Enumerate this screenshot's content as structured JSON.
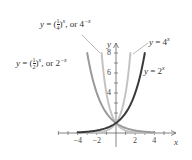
{
  "chart_data": {
    "type": "line",
    "title": "",
    "xlabel": "x",
    "ylabel": "y",
    "xlim": [
      -4.5,
      5
    ],
    "ylim": [
      0,
      8
    ],
    "x_ticks": [
      -4,
      -2,
      2,
      4
    ],
    "x_tick_labels": [
      "−4",
      "−2",
      "2",
      "4"
    ],
    "y_ticks": [
      4,
      6,
      8
    ],
    "y_tick_labels": [
      "4",
      "6",
      "8"
    ],
    "grid": false,
    "series": [
      {
        "name": "y = 2^x",
        "label": "y = 2",
        "exp": "x",
        "color": "#3a3a3a",
        "x": [
          -4,
          -3,
          -2,
          -1,
          0,
          1,
          2,
          3
        ],
        "values": [
          0.0625,
          0.125,
          0.25,
          0.5,
          1,
          2,
          4,
          8
        ]
      },
      {
        "name": "y = 4^x",
        "label": "y = 4",
        "exp": "x",
        "color": "#c4c4c4",
        "x": [
          -4,
          -3,
          -2,
          -1,
          0,
          0.5,
          1,
          1.5
        ],
        "values": [
          0.0039,
          0.0156,
          0.0625,
          0.25,
          1,
          2,
          4,
          8
        ]
      },
      {
        "name": "y = (1/2)^x, or 2^-x",
        "color": "#9a9a9a",
        "x": [
          -3,
          -2,
          -1,
          0,
          1,
          2,
          3,
          4
        ],
        "values": [
          8,
          4,
          2,
          1,
          0.5,
          0.25,
          0.125,
          0.0625
        ]
      },
      {
        "name": "y = (1/4)^x, or 4^-x",
        "color": "#c4c4c4",
        "x": [
          -1.5,
          -1,
          -0.5,
          0,
          1,
          2,
          3,
          4
        ],
        "values": [
          8,
          4,
          2,
          1,
          0.25,
          0.0625,
          0.0156,
          0.0039
        ]
      }
    ],
    "annotations": [
      "y = (1/4)^x, or 4^−x",
      "y = (1/2)^x, or 2^−x",
      "y = 4^x",
      "y = 2^x"
    ]
  },
  "labels": {
    "quarter": {
      "y": "y",
      "eq": " = (",
      "num": "1",
      "den": "4",
      "close": ")",
      "exp": "x",
      "or": ", or 4",
      "or_exp": "−x"
    },
    "half": {
      "y": "y",
      "eq": " = (",
      "num": "1",
      "den": "2",
      "close": ")",
      "exp": "x",
      "or": ", or 2",
      "or_exp": "−x"
    },
    "four": {
      "y": "y",
      "eq": " = 4",
      "exp": "x"
    },
    "two": {
      "y": "y",
      "eq": " = 2",
      "exp": "x"
    }
  },
  "axis": {
    "x_label": "x",
    "y_label": "y"
  }
}
